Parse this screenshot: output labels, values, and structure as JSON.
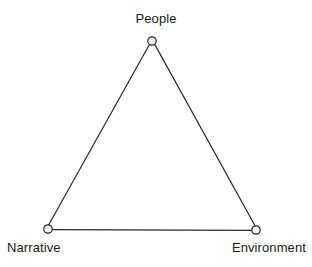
{
  "diagram": {
    "type": "triangle-model",
    "canvas": {
      "width": 312,
      "height": 267,
      "background": "#ffffff"
    },
    "style": {
      "line_color": "#2a2a2a",
      "line_width": 1.2,
      "node_fill": "#ffffff",
      "node_stroke": "#1f1f1f",
      "node_radius": 4.2,
      "label_color": "#1a1a1a"
    },
    "nodes": [
      {
        "id": "people",
        "label": "People",
        "x": 152,
        "y": 41,
        "label_position": "above"
      },
      {
        "id": "narrative",
        "label": "Narrative",
        "x": 48,
        "y": 229,
        "label_position": "below-left"
      },
      {
        "id": "environment",
        "label": "Environment",
        "x": 256,
        "y": 230,
        "label_position": "below-right"
      }
    ],
    "edges": [
      {
        "from": "narrative",
        "to": "people"
      },
      {
        "from": "people",
        "to": "environment"
      },
      {
        "from": "narrative",
        "to": "environment"
      }
    ]
  }
}
